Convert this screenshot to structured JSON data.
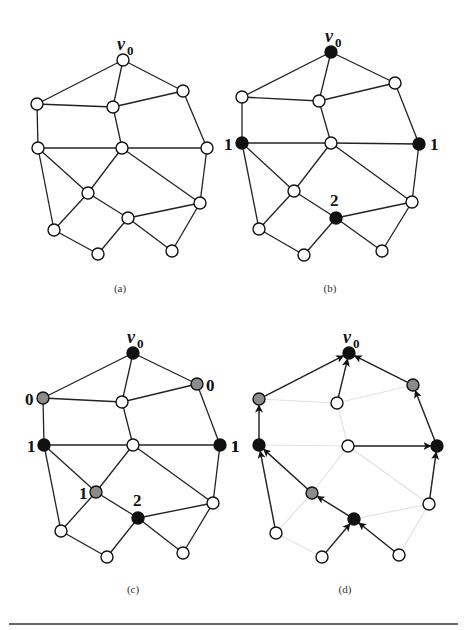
{
  "figure": {
    "colors": {
      "edge": "#222222",
      "faded_edge": "#e2e2e2",
      "node_stroke": "#111111",
      "white": "#ffffff",
      "black": "#111111",
      "gray": "#8c8c8c",
      "rule": "#333333"
    },
    "node_radius": 6,
    "node_ids": [
      "v0",
      "TR",
      "LU",
      "CU",
      "LM",
      "CM",
      "RM",
      "IL",
      "RL",
      "CL",
      "BL",
      "BC",
      "BR"
    ],
    "edges": [
      [
        "v0",
        "LU"
      ],
      [
        "v0",
        "CU"
      ],
      [
        "v0",
        "TR"
      ],
      [
        "LU",
        "CU"
      ],
      [
        "CU",
        "TR"
      ],
      [
        "LU",
        "LM"
      ],
      [
        "CU",
        "CM"
      ],
      [
        "TR",
        "RM"
      ],
      [
        "LM",
        "CM"
      ],
      [
        "CM",
        "RM"
      ],
      [
        "LM",
        "IL"
      ],
      [
        "LM",
        "BL"
      ],
      [
        "CM",
        "IL"
      ],
      [
        "CM",
        "RL"
      ],
      [
        "RM",
        "RL"
      ],
      [
        "IL",
        "CL"
      ],
      [
        "IL",
        "BL"
      ],
      [
        "CL",
        "RL"
      ],
      [
        "BL",
        "BC"
      ],
      [
        "BC",
        "CL"
      ],
      [
        "CL",
        "BR"
      ],
      [
        "BR",
        "RL"
      ]
    ],
    "panels": [
      {
        "id": "a",
        "caption": "(a)",
        "caption_pos": [
          120,
          292
        ],
        "nodes": {
          "v0": [
            123,
            60
          ],
          "TR": [
            183,
            91
          ],
          "LU": [
            37,
            104
          ],
          "CU": [
            113,
            107
          ],
          "LM": [
            38,
            148
          ],
          "CM": [
            122,
            148
          ],
          "RM": [
            207,
            148
          ],
          "IL": [
            88,
            193
          ],
          "RL": [
            200,
            203
          ],
          "CL": [
            128,
            218
          ],
          "BL": [
            54,
            230
          ],
          "BC": [
            98,
            254
          ],
          "BR": [
            172,
            251
          ]
        },
        "fills": {},
        "labels": [],
        "arrows": []
      },
      {
        "id": "b",
        "caption": "(b)",
        "caption_pos": [
          330,
          292
        ],
        "nodes": {
          "v0": [
            331,
            52
          ],
          "TR": [
            395,
            83
          ],
          "LU": [
            242,
            97
          ],
          "CU": [
            319,
            101
          ],
          "LM": [
            242,
            143
          ],
          "CM": [
            331,
            143
          ],
          "RM": [
            419,
            144
          ],
          "IL": [
            294,
            191
          ],
          "RL": [
            412,
            202
          ],
          "CL": [
            336,
            218
          ],
          "BL": [
            259,
            229
          ],
          "BC": [
            304,
            255
          ],
          "BR": [
            382,
            251
          ]
        },
        "fills": {
          "v0": "black",
          "LM": "black",
          "RM": "black",
          "CL": "black"
        },
        "labels": [
          {
            "text": "1",
            "x": 224,
            "y": 150
          },
          {
            "text": "1",
            "x": 430,
            "y": 150
          },
          {
            "text": "2",
            "x": 330,
            "y": 206
          }
        ],
        "arrows": []
      },
      {
        "id": "c",
        "caption": "(c)",
        "caption_pos": [
          133,
          593
        ],
        "nodes": {
          "v0": [
            133,
            353
          ],
          "TR": [
            197,
            384
          ],
          "LU": [
            43,
            398
          ],
          "CU": [
            122,
            402
          ],
          "LM": [
            44,
            445
          ],
          "CM": [
            133,
            445
          ],
          "RM": [
            220,
            445
          ],
          "IL": [
            96,
            492
          ],
          "RL": [
            213,
            503
          ],
          "CL": [
            138,
            518
          ],
          "BL": [
            61,
            531
          ],
          "BC": [
            107,
            557
          ],
          "BR": [
            183,
            553
          ]
        },
        "fills": {
          "v0": "black",
          "LM": "black",
          "RM": "black",
          "CL": "black",
          "TR": "gray",
          "LU": "gray",
          "IL": "gray"
        },
        "labels": [
          {
            "text": "0",
            "x": 25,
            "y": 405
          },
          {
            "text": "0",
            "x": 206,
            "y": 391
          },
          {
            "text": "1",
            "x": 27,
            "y": 452
          },
          {
            "text": "1",
            "x": 231,
            "y": 452
          },
          {
            "text": "1",
            "x": 79,
            "y": 499
          },
          {
            "text": "2",
            "x": 133,
            "y": 506
          }
        ],
        "arrows": []
      },
      {
        "id": "d",
        "caption": "(d)",
        "caption_pos": [
          345,
          593
        ],
        "nodes": {
          "v0": [
            349,
            353
          ],
          "TR": [
            413,
            385
          ],
          "LU": [
            259,
            399
          ],
          "CU": [
            337,
            403
          ],
          "LM": [
            259,
            445
          ],
          "CM": [
            348,
            446
          ],
          "RM": [
            437,
            446
          ],
          "IL": [
            312,
            493
          ],
          "RL": [
            429,
            504
          ],
          "CL": [
            354,
            519
          ],
          "BL": [
            276,
            533
          ],
          "BC": [
            322,
            557
          ],
          "BR": [
            399,
            555
          ]
        },
        "fills": {
          "v0": "black",
          "LM": "black",
          "RM": "black",
          "CL": "black",
          "TR": "gray",
          "LU": "gray",
          "IL": "gray"
        },
        "faded": true,
        "labels": [
          {
            "text": "1",
            "x": 231,
            "y": 452
          }
        ],
        "arrows": [
          [
            "LU",
            "v0"
          ],
          [
            "CU",
            "v0"
          ],
          [
            "TR",
            "v0"
          ],
          [
            "LM",
            "LU"
          ],
          [
            "RM",
            "TR"
          ],
          [
            "CM",
            "RM"
          ],
          [
            "BL",
            "LM"
          ],
          [
            "IL",
            "LM"
          ],
          [
            "CL",
            "IL"
          ],
          [
            "RL",
            "RM"
          ],
          [
            "BC",
            "CL"
          ],
          [
            "BR",
            "CL"
          ]
        ]
      }
    ],
    "rule": {
      "x1": 9,
      "x2": 458,
      "y": 624
    }
  }
}
